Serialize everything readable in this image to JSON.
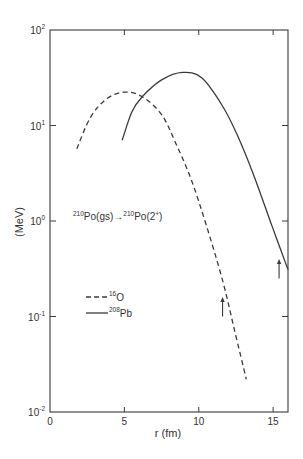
{
  "chart_data": {
    "type": "line",
    "title": "",
    "annotation": "210Po(gs) -> 210Po(2+)",
    "xlabel": "r (fm)",
    "ylabel": "(MeV)",
    "xlim": [
      0,
      16
    ],
    "ylim": [
      0.01,
      100
    ],
    "yscale": "log",
    "grid": false,
    "x_ticks": [
      0,
      5,
      10,
      15
    ],
    "x_tick_labels": [
      "0",
      "5",
      "10",
      "15"
    ],
    "y_ticks": [
      0.01,
      0.1,
      1,
      10,
      100
    ],
    "y_tick_labels": [
      {
        "base": "10",
        "exp": "-2"
      },
      {
        "base": "10",
        "exp": "-1"
      },
      {
        "base": "10",
        "exp": "0"
      },
      {
        "base": "10",
        "exp": "1"
      },
      {
        "base": "10",
        "exp": "2"
      }
    ],
    "legend": {
      "position": "lower-left",
      "entries": [
        {
          "label_sup": "16",
          "label": "O",
          "style": "dashed"
        },
        {
          "label_sup": "208",
          "label": "Pb",
          "style": "solid"
        }
      ]
    },
    "series": [
      {
        "name": "16O",
        "style": "dashed",
        "x": [
          1.8,
          2.7,
          3.8,
          5.0,
          6.2,
          7.5,
          8.5,
          9.5,
          10.5,
          11.6,
          12.4,
          13.2
        ],
        "y": [
          5.7,
          12,
          19,
          22.4,
          20,
          13,
          6.3,
          2.7,
          0.91,
          0.24,
          0.072,
          0.022
        ]
      },
      {
        "name": "208Pb",
        "style": "solid",
        "x": [
          4.85,
          5.5,
          6.2,
          7.5,
          8.9,
          10.2,
          11.6,
          12.6,
          13.7,
          14.9,
          16.0
        ],
        "y": [
          7.0,
          13.8,
          20,
          30,
          36,
          31.6,
          16,
          7.9,
          3.0,
          0.91,
          0.31
        ]
      }
    ],
    "arrows": [
      {
        "series": "16O",
        "x": 11.6,
        "y_from": 0.1,
        "y_to": 0.16,
        "direction": "up"
      },
      {
        "series": "208Pb",
        "x": 15.4,
        "y_from": 0.25,
        "y_to": 0.4,
        "direction": "up"
      }
    ]
  },
  "labels": {
    "annot_pre_sup": "210",
    "annot_pre": "Po(gs)",
    "annot_arrow": "→",
    "annot_post_sup": "210",
    "annot_post": "Po(2",
    "annot_post_sup2": "+",
    "annot_close": ")"
  }
}
